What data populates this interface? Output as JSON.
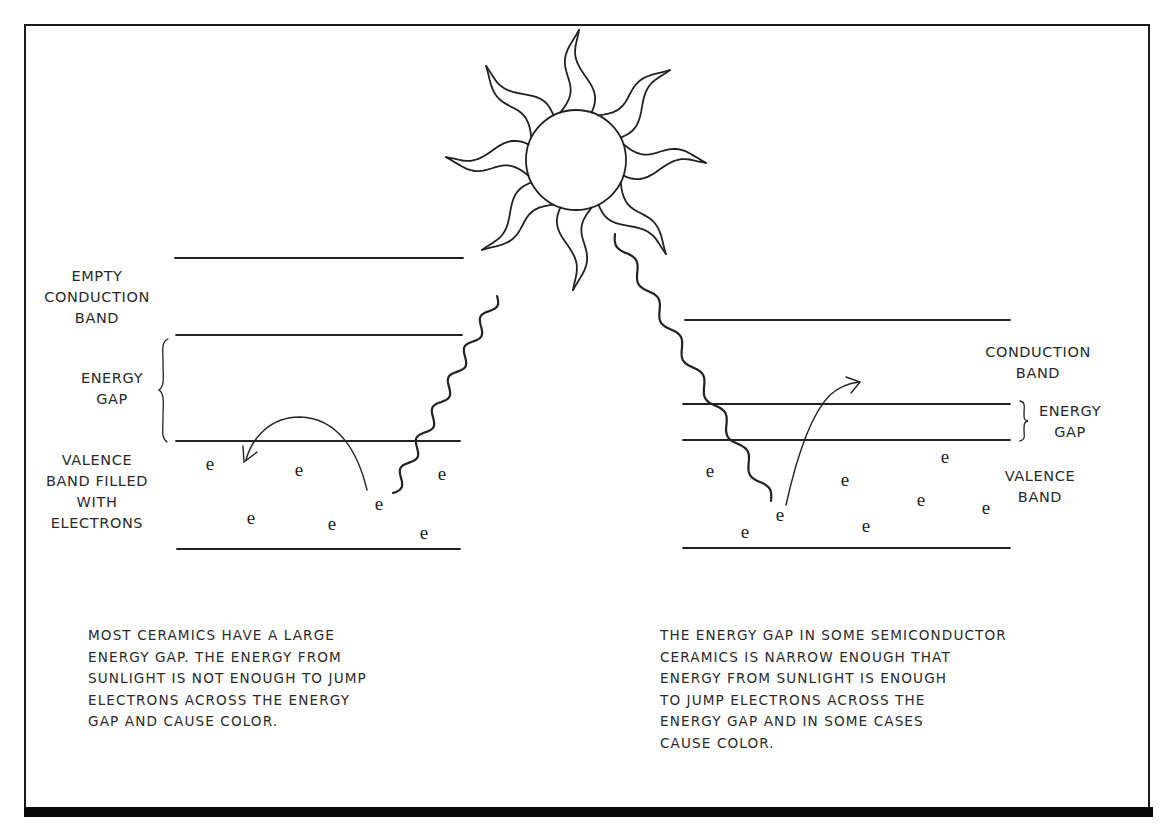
{
  "diagram": {
    "electron_symbol": "e",
    "colors": {
      "ink": "#222222",
      "background": "#ffffff",
      "frame": "#0a0a0a"
    },
    "sun": {
      "label": "sun-icon",
      "rays": 8
    },
    "left_panel": {
      "labels": {
        "conduction": "EMPTY\nCONDUCTION\nBAND",
        "gap": "ENERGY\nGAP",
        "valence": "VALENCE\nBAND FILLED\nWITH\nELECTRONS"
      },
      "electron_count": 7,
      "caption": "MOST CERAMICS HAVE A LARGE\nENERGY GAP. THE ENERGY FROM\nSUNLIGHT IS NOT ENOUGH TO JUMP\nELECTRONS ACROSS THE ENERGY\nGAP AND CAUSE COLOR."
    },
    "right_panel": {
      "labels": {
        "conduction": "CONDUCTION\nBAND",
        "gap": "ENERGY\nGAP",
        "valence": "VALENCE\nBAND"
      },
      "electron_count": 8,
      "caption": "THE ENERGY GAP IN SOME SEMICONDUCTOR\nCERAMICS IS NARROW ENOUGH THAT\nENERGY FROM SUNLIGHT IS ENOUGH\nTO JUMP ELECTRONS ACROSS THE\nENERGY GAP AND IN SOME CASES\nCAUSE COLOR."
    }
  }
}
